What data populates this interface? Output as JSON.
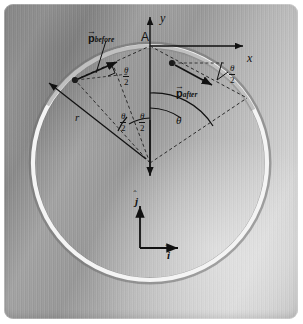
{
  "figure": {
    "background": {
      "style": "brushed-metal-plate",
      "base_color": "#9a9a9a",
      "highlight_color": "#d6d6d6",
      "shadow_color": "#7b7b7b",
      "corner_radius_px": 9,
      "margin_color": "#ffffff"
    },
    "ring": {
      "name": "circular-ring",
      "fill": "none",
      "stroke_light": "#f2f2f2",
      "stroke_shadow": "#6f6f6f",
      "center": {
        "x": 150,
        "y": 163
      },
      "radius_px": 118,
      "stroke_width_px": 6
    },
    "labels": {
      "point_a": "A",
      "axis_x": "x",
      "axis_y": "y",
      "radius": "r",
      "theta": "θ",
      "theta_half_numerator": "θ",
      "theta_half_denominator": "2",
      "unit_vector_i": "i",
      "unit_vector_j": "j",
      "momentum_before_symbol": "p",
      "momentum_before_subscript": "before",
      "momentum_after_symbol": "p",
      "momentum_after_subscript": "after"
    },
    "annotations": {
      "vector_accent": "arrow",
      "unit_vector_accent": "hat",
      "line_styles": {
        "momentum_arrow": "solid",
        "construction_line": "dashed",
        "axis": "solid-with-arrowhead",
        "angle_arc": "solid"
      },
      "colors": {
        "ink": "#111111",
        "dashed_ink": "#2a2a2a"
      }
    },
    "angle_arcs": [
      {
        "name": "theta-half-left",
        "label": "θ/2",
        "from_deg": 90,
        "to_deg": 122
      },
      {
        "name": "theta-half-right",
        "label": "θ/2",
        "from_deg": 58,
        "to_deg": 90
      },
      {
        "name": "theta-right",
        "label": "θ",
        "from_deg": 26,
        "to_deg": 90
      }
    ],
    "particles": [
      {
        "name": "particle-before",
        "x": 75,
        "y": 80,
        "momentum_label": "p_before"
      },
      {
        "name": "particle-after",
        "x": 180,
        "y": 63,
        "momentum_label": "p_after"
      }
    ]
  }
}
